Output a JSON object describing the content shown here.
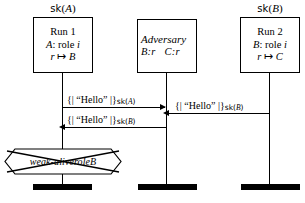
{
  "diagram": {
    "type": "message-sequence-chart",
    "title": "",
    "lanes": [
      {
        "id": "run1",
        "header": {
          "prefix": "sk",
          "arg": "A",
          "full": "sk(A)"
        },
        "box": {
          "line1": "Run 1",
          "line2_var": "A",
          "line2_rest": ": role ",
          "line2_role": "i",
          "line3_lhs": "r",
          "line3_map": "↦",
          "line3_rhs": "B"
        }
      },
      {
        "id": "adversary",
        "header": {
          "prefix": "",
          "arg": "",
          "full": ""
        },
        "box": {
          "title": "Adversary",
          "binding1": "B:r",
          "binding2": "C:r"
        }
      },
      {
        "id": "run2",
        "header": {
          "prefix": "sk",
          "arg": "B",
          "full": "sk(B)"
        },
        "box": {
          "line1": "Run 2",
          "line2_var": "B",
          "line2_rest": ": role ",
          "line2_role": "i",
          "line3_lhs": "r",
          "line3_map": "↦",
          "line3_rhs": "C"
        }
      }
    ],
    "messages": [
      {
        "id": "msg1",
        "from": "run1",
        "to": "adversary",
        "direction": "right",
        "open": "{|",
        "payload": "“Hello”",
        "close": "|}",
        "key_prefix": "sk",
        "key_arg": "A",
        "label_full": "{| “Hello” |}sk(A)"
      },
      {
        "id": "msg2",
        "from": "run2",
        "to": "adversary",
        "direction": "left",
        "open": "{|",
        "payload": "“Hello”",
        "close": "|}",
        "key_prefix": "sk",
        "key_arg": "B",
        "label_full": "{| “Hello” |}sk(B)"
      },
      {
        "id": "msg3",
        "from": "adversary",
        "to": "run1",
        "direction": "left",
        "open": "{|",
        "payload": "“Hello”",
        "close": "|}",
        "key_prefix": "sk",
        "key_arg": "B",
        "label_full": "{| “Hello” |}sk(B)"
      }
    ],
    "claim": {
      "id": "claim-weak-alive",
      "on_lane": "run1",
      "text_main": "weak-alive",
      "text_rest": " role ",
      "text_role": "B",
      "full": "weak-alive role B",
      "state": "falsified",
      "crossed_out": true
    },
    "colors": {
      "stroke": "#000000",
      "background": "#ffffff",
      "terminator": "#000000"
    }
  }
}
